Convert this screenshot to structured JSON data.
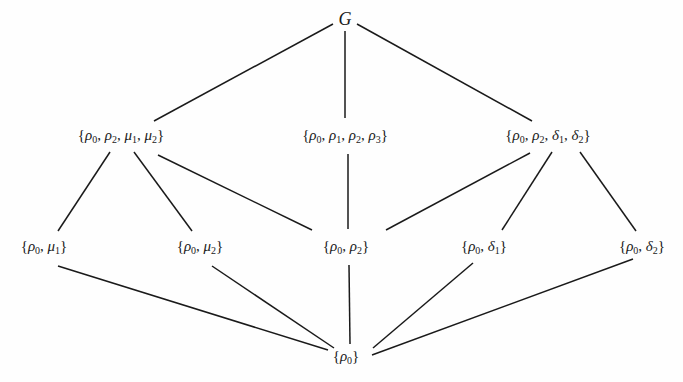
{
  "diagram": {
    "type": "subgroup-lattice",
    "nodes": [
      {
        "id": "G",
        "label": "G",
        "x": 345,
        "y": 19,
        "level": 0
      },
      {
        "id": "n1",
        "label": "{ρ0, ρ2, μ1, μ2}",
        "x": 121,
        "y": 136,
        "level": 1
      },
      {
        "id": "n2",
        "label": "{ρ0, ρ1, ρ2, ρ3}",
        "x": 345,
        "y": 136,
        "level": 1
      },
      {
        "id": "n3",
        "label": "{ρ0, ρ2, δ1, δ2}",
        "x": 548,
        "y": 136,
        "level": 1
      },
      {
        "id": "n4",
        "label": "{ρ0, μ1}",
        "x": 44,
        "y": 247,
        "level": 2
      },
      {
        "id": "n5",
        "label": "{ρ0, μ2}",
        "x": 200,
        "y": 247,
        "level": 2
      },
      {
        "id": "n6",
        "label": "{ρ0, ρ2}",
        "x": 346,
        "y": 247,
        "level": 2
      },
      {
        "id": "n7",
        "label": "{ρ0, δ1}",
        "x": 484,
        "y": 247,
        "level": 2
      },
      {
        "id": "n8",
        "label": "{ρ0, δ2}",
        "x": 642,
        "y": 247,
        "level": 2
      },
      {
        "id": "n9",
        "label": "{ρ0}",
        "x": 346,
        "y": 357,
        "level": 3
      }
    ],
    "edges": [
      {
        "from": "G",
        "to": "n1",
        "x1": 333,
        "y1": 24,
        "x2": 154,
        "y2": 121
      },
      {
        "from": "G",
        "to": "n2",
        "x1": 345,
        "y1": 31,
        "x2": 345,
        "y2": 118
      },
      {
        "from": "G",
        "to": "n3",
        "x1": 357,
        "y1": 24,
        "x2": 532,
        "y2": 121
      },
      {
        "from": "n1",
        "to": "n4",
        "x1": 110,
        "y1": 152,
        "x2": 58,
        "y2": 231
      },
      {
        "from": "n1",
        "to": "n5",
        "x1": 134,
        "y1": 152,
        "x2": 192,
        "y2": 231
      },
      {
        "from": "n1",
        "to": "n6",
        "x1": 158,
        "y1": 155,
        "x2": 312,
        "y2": 230
      },
      {
        "from": "n2",
        "to": "n6",
        "x1": 348,
        "y1": 154,
        "x2": 348,
        "y2": 229
      },
      {
        "from": "n3",
        "to": "n6",
        "x1": 530,
        "y1": 153,
        "x2": 386,
        "y2": 230
      },
      {
        "from": "n3",
        "to": "n7",
        "x1": 552,
        "y1": 152,
        "x2": 502,
        "y2": 230
      },
      {
        "from": "n3",
        "to": "n8",
        "x1": 580,
        "y1": 152,
        "x2": 636,
        "y2": 231
      },
      {
        "from": "n4",
        "to": "n9",
        "x1": 58,
        "y1": 266,
        "x2": 328,
        "y2": 350
      },
      {
        "from": "n5",
        "to": "n9",
        "x1": 212,
        "y1": 266,
        "x2": 334,
        "y2": 348
      },
      {
        "from": "n6",
        "to": "n9",
        "x1": 349,
        "y1": 265,
        "x2": 350,
        "y2": 344
      },
      {
        "from": "n7",
        "to": "n9",
        "x1": 473,
        "y1": 263,
        "x2": 373,
        "y2": 348
      },
      {
        "from": "n8",
        "to": "n9",
        "x1": 633,
        "y1": 259,
        "x2": 372,
        "y2": 355
      }
    ],
    "colors": {
      "line": "#1a1a1a",
      "text": "#1a1a1a",
      "background": "#fefefe"
    }
  }
}
